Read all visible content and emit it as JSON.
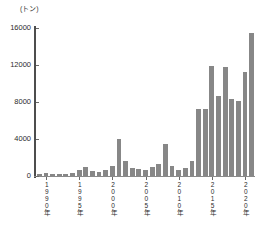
{
  "chart_data": {
    "type": "bar",
    "title": "",
    "subtitle": "",
    "xlabel": "",
    "ylabel": "",
    "unit_label": "(トン)",
    "ylim": [
      0,
      16000
    ],
    "ytick_values": [
      0,
      4000,
      8000,
      12000,
      16000
    ],
    "ytick_labels": [
      "0",
      "4000",
      "8000",
      "12000",
      "16000"
    ],
    "grid": false,
    "legend": false,
    "legend_position": "none",
    "bar_color": "#878787",
    "axis_color": "#4d4d4d",
    "xtick_labels": [
      "1990年",
      "1995年",
      "2000年",
      "2005年",
      "2010年",
      "2015年",
      "2020年"
    ],
    "xtick_categories": [
      1990,
      1995,
      2000,
      2005,
      2010,
      2015,
      2020
    ],
    "categories": [
      1989,
      1990,
      1991,
      1992,
      1993,
      1994,
      1995,
      1996,
      1997,
      1998,
      1999,
      2000,
      2001,
      2002,
      2003,
      2004,
      2005,
      2006,
      2007,
      2008,
      2009,
      2010,
      2011,
      2012,
      2013,
      2014,
      2015,
      2016,
      2017,
      2018,
      2019,
      2020,
      2021
    ],
    "values": [
      250,
      300,
      260,
      240,
      230,
      300,
      700,
      950,
      520,
      420,
      700,
      1050,
      3950,
      1600,
      900,
      800,
      600,
      950,
      1250,
      3500,
      1100,
      650,
      900,
      1600,
      7200,
      7200,
      11900,
      8600,
      11800,
      8300,
      8100,
      11200,
      15500
    ],
    "values_note": "トン"
  }
}
